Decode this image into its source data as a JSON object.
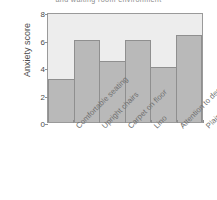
{
  "chart_data": {
    "type": "bar",
    "title": "and waiting room environment",
    "xlabel": "",
    "ylabel": "Anxiety score",
    "categories": [
      "Comfortable seating",
      "Upright chairs",
      "Carpet on floor",
      "Lino",
      "Attention to decor",
      "Plain walls"
    ],
    "values": [
      3.1,
      6.0,
      4.45,
      6.0,
      4.0,
      6.3
    ],
    "ylim": [
      0,
      8
    ],
    "yticks": [
      "0",
      "2",
      "4",
      "6",
      "8"
    ],
    "ytick_values": [
      0,
      2,
      4,
      6,
      8
    ],
    "grid": false,
    "legend": null,
    "colors": {
      "bar_fill": "#b9b9b9",
      "bar_edge": "#8f8f8f",
      "plot_background": "#ededed",
      "axis_text": "#4a4a4a",
      "tick_label": "#6f6f6f",
      "title_text": "#8d8d8d",
      "figure_background": "#ffffff"
    }
  }
}
